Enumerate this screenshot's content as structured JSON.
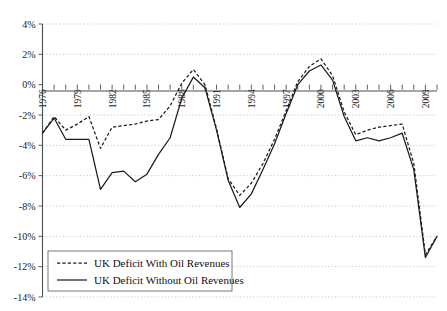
{
  "chart_data": {
    "type": "line",
    "title": "",
    "subtitle": "",
    "xlabel": "",
    "ylabel": "",
    "grid": true,
    "legend_position": "bottom-left",
    "xlim": [
      1976,
      2010
    ],
    "ylim": [
      -14,
      4
    ],
    "ytick_labels": [
      "4%",
      "2%",
      "0%",
      "-2%",
      "-4%",
      "-6%",
      "-8%",
      "-10%",
      "-12%",
      "-14%"
    ],
    "ytick_values": [
      4,
      2,
      0,
      -2,
      -4,
      -6,
      -8,
      -10,
      -12,
      -14
    ],
    "xtick_labels": [
      "1976",
      "1979",
      "1982",
      "1985",
      "1988",
      "1991",
      "1994",
      "1997",
      "2000",
      "2003",
      "2006",
      "2009"
    ],
    "xtick_values": [
      1976,
      1979,
      1982,
      1985,
      1988,
      1991,
      1994,
      1997,
      2000,
      2003,
      2006,
      2009
    ],
    "x": [
      1976,
      1977,
      1978,
      1979,
      1980,
      1981,
      1982,
      1983,
      1984,
      1985,
      1986,
      1987,
      1988,
      1989,
      1990,
      1991,
      1992,
      1993,
      1994,
      1995,
      1996,
      1997,
      1998,
      1999,
      2000,
      2001,
      2002,
      2003,
      2004,
      2005,
      2006,
      2007,
      2008,
      2009,
      2010
    ],
    "series": [
      {
        "name": "UK Deficit With Oil Revenues",
        "style": "dashed",
        "color": "#1c1c1c",
        "values": [
          -3.2,
          -2.1,
          -3.0,
          -2.6,
          -2.1,
          -4.2,
          -2.8,
          -2.7,
          -2.6,
          -2.4,
          -2.3,
          -1.4,
          0.1,
          1.0,
          0.0,
          -2.9,
          -6.2,
          -7.3,
          -6.5,
          -5.2,
          -3.6,
          -1.7,
          0.2,
          1.2,
          1.7,
          0.6,
          -1.8,
          -3.3,
          -3.0,
          -2.8,
          -2.7,
          -2.6,
          -5.2,
          -11.2,
          -10.0
        ]
      },
      {
        "name": "UK Deficit Without Oil Revenues",
        "style": "solid",
        "color": "#1c1c1c",
        "values": [
          -3.2,
          -2.2,
          -3.6,
          -3.6,
          -3.6,
          -6.9,
          -5.8,
          -5.7,
          -6.4,
          -5.9,
          -4.6,
          -3.5,
          -0.9,
          0.5,
          -0.2,
          -3.0,
          -6.3,
          -8.1,
          -7.2,
          -5.6,
          -3.9,
          -1.9,
          0.0,
          0.9,
          1.3,
          0.3,
          -2.1,
          -3.7,
          -3.5,
          -3.7,
          -3.5,
          -3.2,
          -5.6,
          -11.4,
          -10.0
        ]
      }
    ]
  },
  "legend": {
    "items": [
      {
        "label": "UK Deficit With Oil Revenues",
        "style": "dashed"
      },
      {
        "label": "UK Deficit Without Oil Revenues",
        "style": "solid"
      }
    ]
  }
}
